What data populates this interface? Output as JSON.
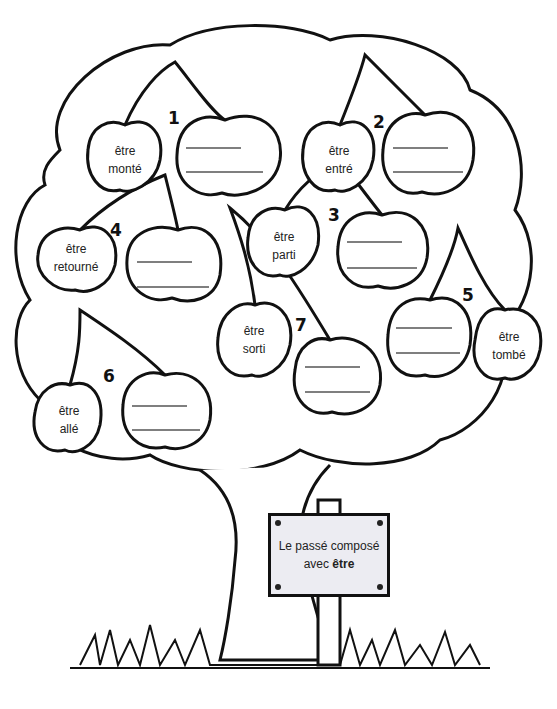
{
  "sign": {
    "line1": "Le passé composé",
    "line2_prefix": "avec ",
    "line2_bold": "être"
  },
  "groups": [
    {
      "number": "1",
      "verb_line1": "être",
      "verb_line2": "monté"
    },
    {
      "number": "2",
      "verb_line1": "être",
      "verb_line2": "entré"
    },
    {
      "number": "3",
      "verb_line1": "être",
      "verb_line2": "parti"
    },
    {
      "number": "4",
      "verb_line1": "être",
      "verb_line2": "retourné"
    },
    {
      "number": "5",
      "verb_line1": "être",
      "verb_line2": "tombé"
    },
    {
      "number": "6",
      "verb_line1": "être",
      "verb_line2": "allé"
    },
    {
      "number": "7",
      "verb_line1": "être",
      "verb_line2": "sorti"
    }
  ],
  "colors": {
    "ink": "#111111",
    "sign_fill": "#ececf2",
    "answer_line": "#555555"
  }
}
